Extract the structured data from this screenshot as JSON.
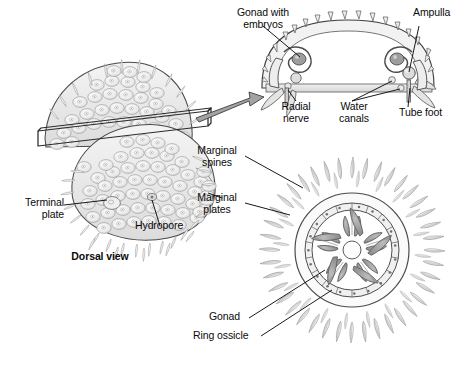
{
  "figure": {
    "type": "biological-anatomy-diagram",
    "background_color": "#ffffff",
    "ink_color": "#1a1a1a",
    "fill_gray_light": "#e8e8e8",
    "fill_gray_mid": "#b8b8b8",
    "fill_gray_dark": "#9a9a9a"
  },
  "panels": {
    "dorsal": {
      "caption": "Dorsal view"
    },
    "cross_section": {
      "name": "sagittal-cross-section"
    },
    "internal": {
      "name": "internal-ring-view"
    }
  },
  "labels": {
    "gonad_with_embryos": "Gonad with\nembryos",
    "ampulla": "Ampulla",
    "radial_nerve": "Radial\nnerve",
    "water_canals": "Water\ncanals",
    "tube_foot": "Tube foot",
    "marginal_spines": "Marginal\nspines",
    "marginal_plates": "Marginal\nplates",
    "terminal_plate": "Terminal\nplate",
    "hydropore": "Hydropore",
    "dorsal_view": "Dorsal view",
    "gonad": "Gonad",
    "ring_ossicle": "Ring ossicle"
  }
}
